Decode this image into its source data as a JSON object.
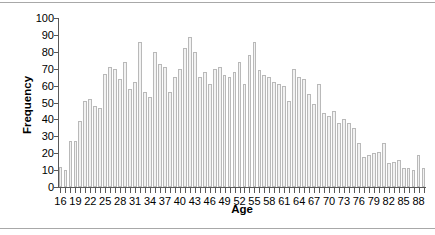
{
  "chart_data": {
    "type": "bar",
    "title": "",
    "xlabel": "Age",
    "ylabel": "Frequency",
    "xlim": [
      15.5,
      89.5
    ],
    "ylim": [
      0,
      100
    ],
    "ytick_step": 10,
    "xtick_label_step": 3,
    "grid": false,
    "legend": null,
    "bar_color": "#f2f2f2",
    "bar_border_color": "#b9b9b9",
    "axis_color": "#595959",
    "categories": [
      16,
      17,
      18,
      19,
      20,
      21,
      22,
      23,
      24,
      25,
      26,
      27,
      28,
      29,
      30,
      31,
      32,
      33,
      34,
      35,
      36,
      37,
      38,
      39,
      40,
      41,
      42,
      43,
      44,
      45,
      46,
      47,
      48,
      49,
      50,
      51,
      52,
      53,
      54,
      55,
      56,
      57,
      58,
      59,
      60,
      61,
      62,
      63,
      64,
      65,
      66,
      67,
      68,
      69,
      70,
      71,
      72,
      73,
      74,
      75,
      76,
      77,
      78,
      79,
      80,
      81,
      82,
      83,
      84,
      85,
      86,
      87,
      88,
      89
    ],
    "values": [
      12,
      10,
      27,
      27,
      39,
      51,
      52,
      48,
      47,
      67,
      71,
      70,
      64,
      74,
      58,
      62,
      86,
      56,
      53,
      80,
      73,
      71,
      56,
      65,
      70,
      82,
      89,
      80,
      65,
      68,
      61,
      70,
      71,
      66,
      65,
      68,
      74,
      61,
      78,
      86,
      69,
      66,
      65,
      62,
      61,
      60,
      51,
      70,
      65,
      64,
      55,
      49,
      61,
      44,
      42,
      45,
      38,
      40,
      38,
      35,
      26,
      18,
      19,
      20,
      21,
      26,
      14,
      15,
      16,
      11,
      11,
      10,
      19,
      11
    ],
    "ytick_labels": [
      "100",
      "90",
      "80",
      "70",
      "60",
      "50",
      "40",
      "30",
      "20",
      "10",
      "0"
    ],
    "xtick_labels": [
      "16",
      "19",
      "22",
      "25",
      "28",
      "31",
      "34",
      "37",
      "40",
      "43",
      "46",
      "49",
      "52",
      "55",
      "58",
      "61",
      "64",
      "67",
      "70",
      "73",
      "76",
      "79",
      "82",
      "85",
      "88"
    ]
  }
}
